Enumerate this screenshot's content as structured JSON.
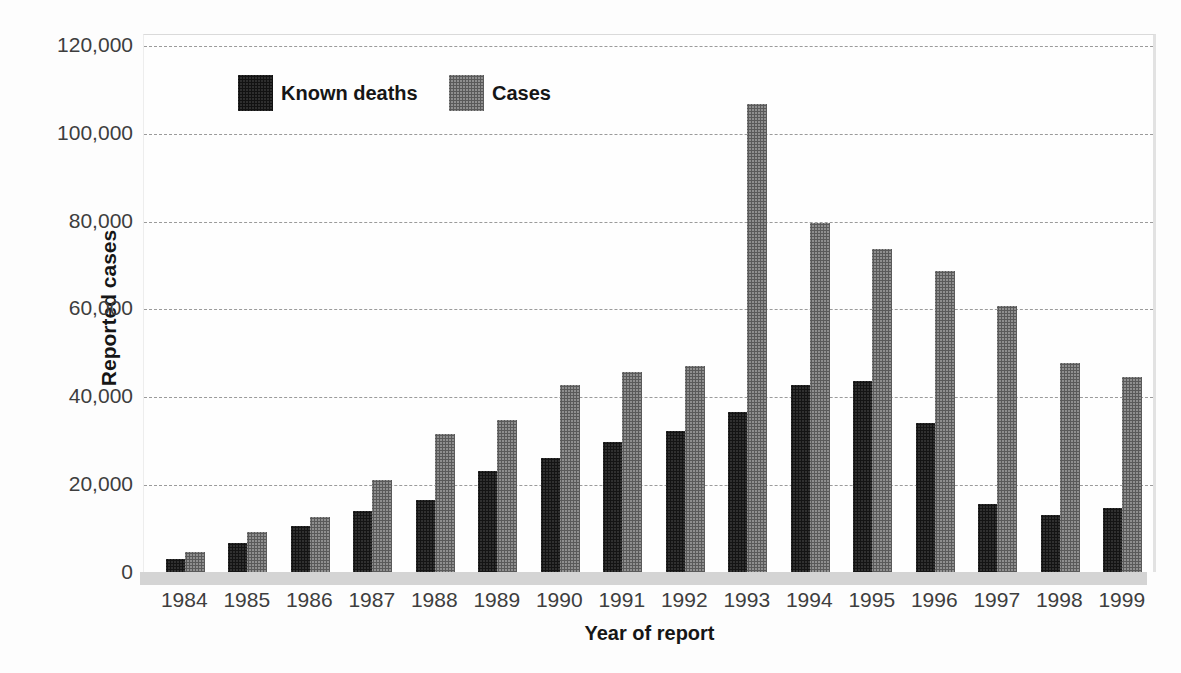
{
  "chart_data": {
    "type": "bar",
    "title": "",
    "xlabel": "Year of report",
    "ylabel": "Reported cases",
    "categories": [
      "1984",
      "1985",
      "1986",
      "1987",
      "1988",
      "1989",
      "1990",
      "1991",
      "1992",
      "1993",
      "1994",
      "1995",
      "1996",
      "1997",
      "1998",
      "1999"
    ],
    "series": [
      {
        "name": "Known deaths",
        "color": "#2e2e2e",
        "values": [
          3000,
          6500,
          10500,
          14000,
          16500,
          23000,
          26000,
          29500,
          32000,
          36500,
          42500,
          43500,
          34000,
          15500,
          13000,
          14500
        ]
      },
      {
        "name": "Cases",
        "color": "#8f8f8f",
        "values": [
          4500,
          9000,
          12500,
          21000,
          31500,
          34500,
          42500,
          45500,
          47000,
          106500,
          79500,
          73500,
          68500,
          60500,
          47500,
          44500
        ]
      }
    ],
    "ylim": [
      0,
      120000
    ],
    "yticks": [
      0,
      20000,
      40000,
      60000,
      80000,
      100000,
      120000
    ],
    "ytick_labels": [
      "0",
      "20,000",
      "40,000",
      "60,000",
      "80,000",
      "100,000",
      "120,000"
    ],
    "grid": "horizontal-dashed",
    "legend_position": "top-left-inside",
    "colors": {
      "known_deaths_bar": "#2e2e2e",
      "cases_bar": "#8f8f8f",
      "gridline": "#9b9b9b",
      "axis_strip": "#d4d4d4",
      "tick_text": "#3e3e3e",
      "title_text": "#161616"
    }
  }
}
